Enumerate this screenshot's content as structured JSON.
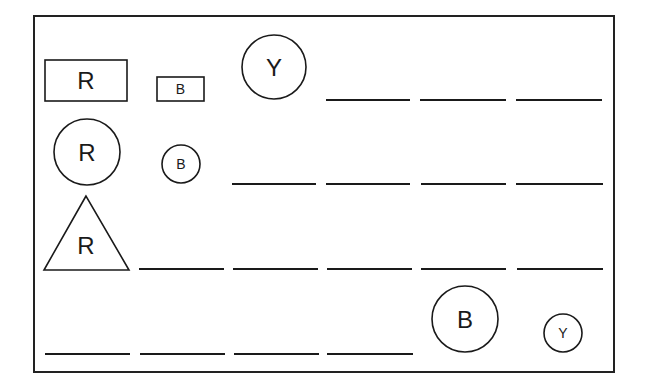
{
  "diagram": {
    "title": "",
    "frame": {
      "x": 34,
      "y": 16,
      "w": 580,
      "h": 356
    },
    "shapes": [
      {
        "id": "rect-r-large",
        "type": "rect",
        "label": "R",
        "x": 45,
        "y": 60,
        "w": 82,
        "h": 41,
        "font": 24
      },
      {
        "id": "rect-b-small",
        "type": "rect",
        "label": "B",
        "x": 157,
        "y": 77,
        "w": 47,
        "h": 24,
        "font": 14
      },
      {
        "id": "circle-y-large",
        "type": "circle",
        "label": "Y",
        "cx": 274,
        "cy": 67,
        "r": 32,
        "font": 24
      },
      {
        "id": "circle-r-large",
        "type": "circle",
        "label": "R",
        "cx": 87,
        "cy": 152,
        "r": 33,
        "font": 24
      },
      {
        "id": "circle-b-small",
        "type": "circle",
        "label": "B",
        "cx": 181,
        "cy": 164,
        "r": 19,
        "font": 14
      },
      {
        "id": "triangle-r-large",
        "type": "triangle",
        "label": "R",
        "points": [
          [
            86,
            196
          ],
          [
            44,
            270
          ],
          [
            129,
            270
          ]
        ],
        "tx": 86,
        "ty": 245,
        "font": 24
      },
      {
        "id": "circle-b-large",
        "type": "circle",
        "label": "B",
        "cx": 465,
        "cy": 319,
        "r": 33,
        "font": 24
      },
      {
        "id": "circle-y-small",
        "type": "circle",
        "label": "Y",
        "cx": 563,
        "cy": 333,
        "r": 19,
        "font": 14
      }
    ],
    "blanks": [
      {
        "row": 1,
        "y": 100,
        "x1": 326,
        "x2": 410
      },
      {
        "row": 1,
        "y": 100,
        "x1": 420,
        "x2": 506
      },
      {
        "row": 1,
        "y": 100,
        "x1": 516,
        "x2": 602
      },
      {
        "row": 2,
        "y": 184,
        "x1": 232,
        "x2": 316
      },
      {
        "row": 2,
        "y": 184,
        "x1": 326,
        "x2": 410
      },
      {
        "row": 2,
        "y": 184,
        "x1": 421,
        "x2": 506
      },
      {
        "row": 2,
        "y": 184,
        "x1": 516,
        "x2": 603
      },
      {
        "row": 3,
        "y": 269,
        "x1": 139,
        "x2": 224
      },
      {
        "row": 3,
        "y": 269,
        "x1": 233,
        "x2": 318
      },
      {
        "row": 3,
        "y": 269,
        "x1": 327,
        "x2": 412
      },
      {
        "row": 3,
        "y": 269,
        "x1": 421,
        "x2": 506
      },
      {
        "row": 3,
        "y": 269,
        "x1": 517,
        "x2": 603
      },
      {
        "row": 4,
        "y": 354,
        "x1": 45,
        "x2": 130
      },
      {
        "row": 4,
        "y": 354,
        "x1": 140,
        "x2": 225
      },
      {
        "row": 4,
        "y": 354,
        "x1": 234,
        "x2": 319
      },
      {
        "row": 4,
        "y": 354,
        "x1": 327,
        "x2": 413
      }
    ]
  }
}
